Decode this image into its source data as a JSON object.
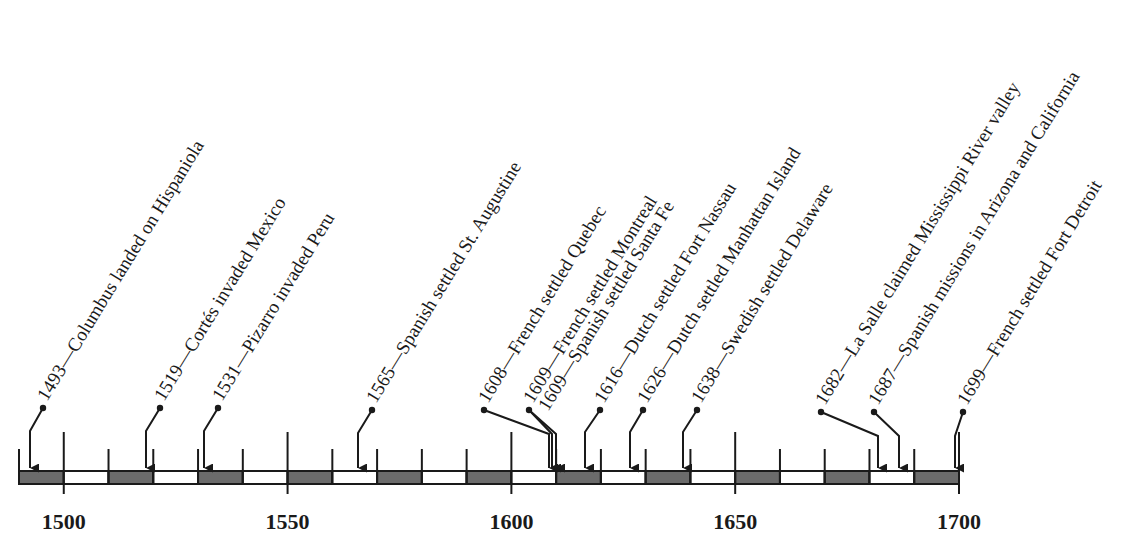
{
  "timeline": {
    "start_year": 1490,
    "end_year": 1700,
    "segment_years": 10,
    "major_tick_years": [
      1500,
      1550,
      1600,
      1650,
      1700
    ],
    "axis_labels": [
      "1500",
      "1550",
      "1600",
      "1650",
      "1700"
    ],
    "colors": {
      "ink": "#1a1a1a",
      "shaded_segment": "#6b6b6b",
      "unshaded_segment": "#ffffff"
    },
    "events": [
      {
        "year": 1493,
        "label": "1493—Columbus landed on Hispaniola",
        "dot": [
          43,
          408
        ],
        "elbow": [
          30,
          431
        ]
      },
      {
        "year": 1519,
        "label": "1519—Cortés invaded Mexico",
        "dot": [
          160,
          408
        ],
        "elbow": [
          146,
          431
        ]
      },
      {
        "year": 1531,
        "label": "1531—Pizarro invaded Peru",
        "dot": [
          218,
          408
        ],
        "elbow": [
          204,
          431
        ]
      },
      {
        "year": 1565,
        "label": "1565—Spanish settled St. Augustine",
        "dot": [
          372,
          410
        ],
        "elbow": [
          358,
          433
        ]
      },
      {
        "year": 1608,
        "label": "1608—French settled Quebec",
        "dot": [
          484,
          410
        ],
        "elbow": [
          549,
          434
        ]
      },
      {
        "year": 1609,
        "label": "1609—French settled Montreal",
        "dot": [
          529,
          410
        ],
        "elbow": [
          552,
          434
        ]
      },
      {
        "year": 1609,
        "label": "1609—Spanish settled Santa Fe",
        "dot": null,
        "elbow": [
          556,
          434
        ],
        "label_anchor": [
          548,
          412
        ]
      },
      {
        "year": 1616,
        "label": "1616—Dutch settled Fort Nassau",
        "dot": [
          600,
          410
        ],
        "elbow": [
          585,
          432
        ]
      },
      {
        "year": 1626,
        "label": "1626—Dutch settled Manhattan Island",
        "dot": [
          643,
          410
        ],
        "elbow": [
          630,
          432
        ]
      },
      {
        "year": 1638,
        "label": "1638—Swedish settled Delaware",
        "dot": [
          697,
          410
        ],
        "elbow": [
          683,
          432
        ]
      },
      {
        "year": 1682,
        "label": "1682—La Salle claimed Mississippi River valley",
        "dot": [
          821,
          412
        ],
        "elbow": [
          878,
          436
        ]
      },
      {
        "year": 1687,
        "label": "1687—Spanish missions in Arizona and California",
        "dot": [
          874,
          412
        ],
        "elbow": [
          899,
          436
        ]
      },
      {
        "year": 1699,
        "label": "1699—French settled Fort Detroit",
        "dot": [
          963,
          412
        ],
        "elbow": [
          955,
          436
        ]
      }
    ]
  }
}
